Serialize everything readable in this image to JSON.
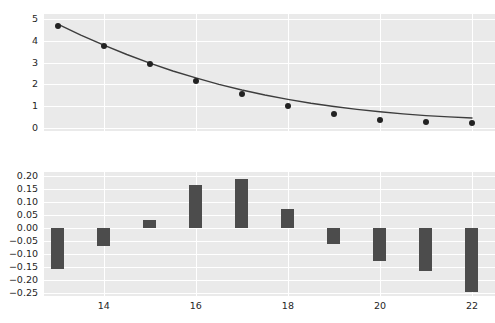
{
  "figure": {
    "background_color": "#ffffff",
    "axes_face_color": "#eaeaea",
    "grid_color": "#ffffff",
    "marker_color": "#222222",
    "line_color": "#3d3d3d",
    "bar_color": "#4c4c4c"
  },
  "chart_data": [
    {
      "type": "scatter",
      "title": "",
      "xlabel": "",
      "ylabel": "",
      "xlim": [
        12.7,
        22.5
      ],
      "ylim": [
        -0.15,
        5.25
      ],
      "grid": true,
      "legend": null,
      "xticks": [
        14,
        16,
        18,
        20,
        22
      ],
      "xticklabels": [
        "",
        "",
        "",
        "",
        ""
      ],
      "yticks": [
        0,
        1,
        2,
        3,
        4,
        5
      ],
      "yticklabels": [
        "0",
        "1",
        "2",
        "3",
        "4",
        "5"
      ],
      "series": [
        {
          "name": "observed",
          "kind": "scatter",
          "x": [
            13,
            14,
            15,
            16,
            17,
            18,
            19,
            20,
            21,
            22
          ],
          "values": [
            4.7,
            3.78,
            2.93,
            2.17,
            1.57,
            1.0,
            0.62,
            0.38,
            0.27,
            0.2
          ]
        },
        {
          "name": "fitted curve",
          "kind": "line",
          "x": [
            13,
            13.5,
            14,
            14.5,
            15,
            15.5,
            16,
            16.5,
            17,
            17.5,
            18,
            18.5,
            19,
            19.5,
            20,
            20.5,
            21,
            21.5,
            22
          ],
          "values": [
            4.78,
            4.28,
            3.81,
            3.38,
            2.98,
            2.62,
            2.3,
            2.0,
            1.74,
            1.51,
            1.31,
            1.13,
            0.98,
            0.85,
            0.74,
            0.64,
            0.56,
            0.5,
            0.45
          ]
        }
      ]
    },
    {
      "type": "bar",
      "title": "",
      "xlabel": "",
      "ylabel": "",
      "xlim": [
        12.7,
        22.5
      ],
      "ylim": [
        -0.26,
        0.215
      ],
      "grid": true,
      "legend": null,
      "xticks": [
        14,
        16,
        18,
        20,
        22
      ],
      "xticklabels": [
        "14",
        "16",
        "18",
        "20",
        "22"
      ],
      "yticks": [
        -0.25,
        -0.2,
        -0.15,
        -0.1,
        -0.05,
        0.0,
        0.05,
        0.1,
        0.15,
        0.2
      ],
      "yticklabels": [
        "−0.25",
        "−0.20",
        "−0.15",
        "−0.10",
        "−0.05",
        "0.00",
        "0.05",
        "0.10",
        "0.15",
        "0.20"
      ],
      "categories": [
        13,
        14,
        15,
        16,
        17,
        18,
        19,
        20,
        21,
        22
      ],
      "values": [
        -0.155,
        -0.068,
        0.03,
        0.165,
        0.19,
        0.075,
        -0.06,
        -0.125,
        -0.165,
        -0.245
      ]
    }
  ]
}
